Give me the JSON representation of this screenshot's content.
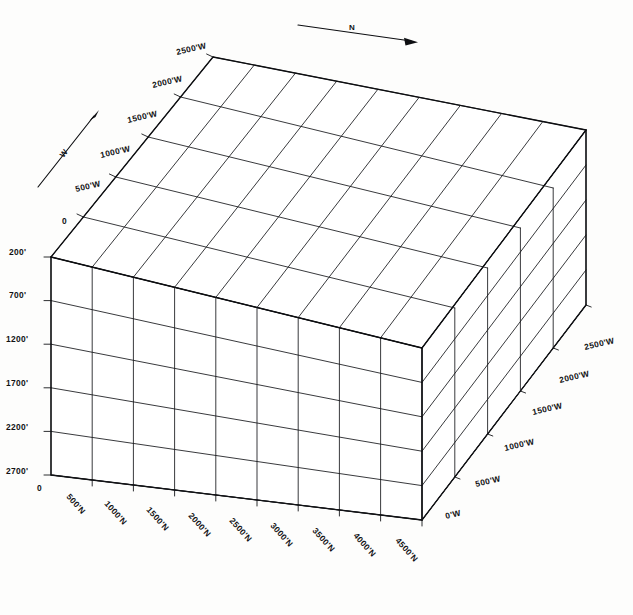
{
  "figure": {
    "background_color": "#fdfdfc",
    "line_color": "#15161a",
    "edge_color": "#0d0e11"
  },
  "compass": {
    "north": {
      "label": "N",
      "icon": "arrow-right-icon",
      "x1": 298,
      "y1": 25,
      "x2": 417,
      "y2": 42
    },
    "west": {
      "label": "W",
      "icon": "arrow-up-right-icon",
      "x1": 38,
      "y1": 187,
      "x2": 99,
      "y2": 110
    }
  },
  "axes": {
    "depth_west": {
      "name": "West (depth)",
      "unit": "feet",
      "origin_label": "0",
      "labels": [
        "500'W",
        "1000'W",
        "1500'W",
        "2000'W",
        "2500'W"
      ],
      "values": [
        500,
        1000,
        1500,
        2000,
        2500
      ],
      "interval": 500
    },
    "depth_west_right": {
      "name": "West (right side)",
      "unit": "feet",
      "labels": [
        "0'W",
        "500'W",
        "1000'W",
        "1500'W",
        "2000'W",
        "2500'W"
      ],
      "values": [
        0,
        500,
        1000,
        1500,
        2000,
        2500
      ],
      "interval": 500
    },
    "horizontal_north": {
      "name": "North (width)",
      "unit": "feet",
      "origin_label": "0",
      "labels": [
        "500'N",
        "1000'N",
        "1500'N",
        "2000'N",
        "2500'N",
        "3000'N",
        "3500'N",
        "4000'N",
        "4500'N"
      ],
      "values": [
        500,
        1000,
        1500,
        2000,
        2500,
        3000,
        3500,
        4000,
        4500
      ],
      "interval": 500
    },
    "vertical_elevation": {
      "name": "Elevation (depth below)",
      "unit": "feet",
      "labels": [
        "200'",
        "700'",
        "1200'",
        "1700'",
        "2200'",
        "2700'"
      ],
      "values": [
        200,
        700,
        1200,
        1700,
        2200,
        2700
      ],
      "interval": 500,
      "origin_label": "0"
    }
  },
  "grid": {
    "columns_north": 9,
    "rows_vertical": 5,
    "cells_west": 5
  },
  "labels_left": [
    {
      "text": "200'",
      "x": 9,
      "y": 255
    },
    {
      "text": "700'",
      "x": 9,
      "y": 298
    },
    {
      "text": "1200'",
      "x": 6,
      "y": 342
    },
    {
      "text": "1700'",
      "x": 6,
      "y": 386
    },
    {
      "text": "2200'",
      "x": 6,
      "y": 430
    },
    {
      "text": "2700'",
      "x": 6,
      "y": 474
    }
  ],
  "labels_upper_left": [
    {
      "text": "0",
      "x": 62,
      "y": 224
    },
    {
      "text": "500'W",
      "x": 76,
      "y": 192
    },
    {
      "text": "1000'W",
      "x": 101,
      "y": 158
    },
    {
      "text": "1500'W",
      "x": 128,
      "y": 123
    },
    {
      "text": "2000'W",
      "x": 153,
      "y": 88
    },
    {
      "text": "2500'W",
      "x": 177,
      "y": 55
    }
  ],
  "labels_bottom": [
    {
      "text": "500'N",
      "x": 66,
      "y": 497
    },
    {
      "text": "1000'N",
      "x": 98,
      "y": 505
    },
    {
      "text": "1500'N",
      "x": 140,
      "y": 513
    },
    {
      "text": "2000'N",
      "x": 182,
      "y": 521
    },
    {
      "text": "2500'N",
      "x": 224,
      "y": 529
    },
    {
      "text": "3000'N",
      "x": 266,
      "y": 537
    },
    {
      "text": "3500'N",
      "x": 308,
      "y": 545
    },
    {
      "text": "4000'N",
      "x": 350,
      "y": 552
    },
    {
      "text": "4500'N",
      "x": 392,
      "y": 560
    }
  ],
  "labels_right": [
    {
      "text": "0'W",
      "x": 446,
      "y": 516
    },
    {
      "text": "500'W",
      "x": 478,
      "y": 484
    },
    {
      "text": "1000'W",
      "x": 507,
      "y": 449
    },
    {
      "text": "1500'W",
      "x": 534,
      "y": 414
    },
    {
      "text": "2000'W",
      "x": 559,
      "y": 382
    },
    {
      "text": "2500'W",
      "x": 584,
      "y": 349
    }
  ],
  "labels_origin": [
    {
      "text": "0",
      "x": 37,
      "y": 489
    }
  ]
}
